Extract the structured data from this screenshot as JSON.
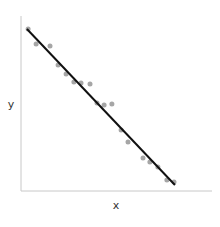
{
  "chart_data": {
    "type": "scatter",
    "title": "",
    "xlabel": "x",
    "ylabel": "y",
    "xlim": [
      0,
      10
    ],
    "ylim": [
      0,
      10
    ],
    "grid": false,
    "legend": null,
    "ticks": {
      "x": [],
      "y": []
    },
    "series": [
      {
        "name": "points",
        "kind": "scatter",
        "color": "#a6a6a6",
        "x": [
          0.37,
          0.79,
          1.52,
          1.94,
          2.36,
          2.77,
          3.14,
          3.61,
          3.98,
          4.35,
          4.76,
          5.24,
          5.6,
          6.39,
          6.75,
          7.17,
          7.64,
          8.01
        ],
        "y": [
          9.26,
          8.4,
          8.29,
          7.2,
          6.69,
          6.23,
          6.17,
          6.11,
          5.03,
          4.91,
          4.97,
          3.49,
          2.8,
          1.89,
          1.66,
          1.37,
          0.63,
          0.51
        ]
      },
      {
        "name": "fit",
        "kind": "line",
        "color": "#111111",
        "x": [
          0.31,
          8.06
        ],
        "y": [
          9.26,
          0.34
        ]
      }
    ]
  },
  "labels": {
    "x": "x",
    "y": "y"
  },
  "layout": {
    "plot_left": 21,
    "plot_right": 212,
    "plot_top": 16,
    "plot_bottom": 191,
    "axis_color": "#c8c8c8",
    "point_radius": 2.5
  }
}
